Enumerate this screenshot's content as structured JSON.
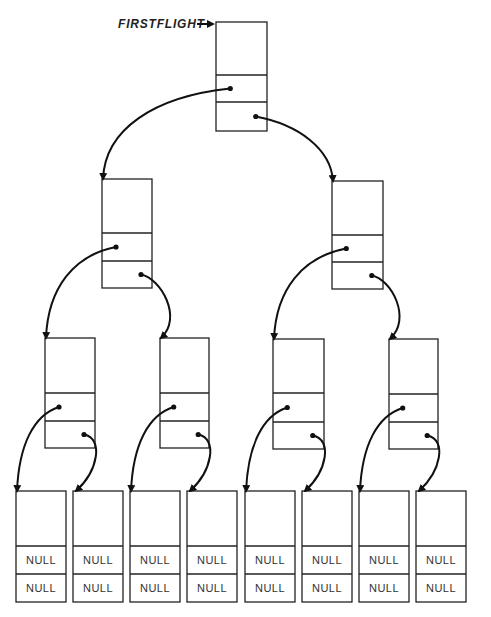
{
  "root_label": "FIRSTFLIGHT",
  "null_text": "NULL",
  "nodes": [
    {
      "id": "root",
      "x": 216,
      "y": 22,
      "w": 51,
      "h": 109,
      "d1": 75,
      "d2": 102
    },
    {
      "id": "l1-left",
      "x": 102,
      "y": 179,
      "w": 50,
      "h": 109,
      "d1": 233,
      "d2": 261
    },
    {
      "id": "l1-right",
      "x": 332,
      "y": 181,
      "w": 51,
      "h": 108,
      "d1": 235,
      "d2": 262
    },
    {
      "id": "l2-0",
      "x": 45,
      "y": 338,
      "w": 50,
      "h": 110,
      "d1": 393,
      "d2": 421
    },
    {
      "id": "l2-1",
      "x": 160,
      "y": 338,
      "w": 49,
      "h": 110,
      "d1": 393,
      "d2": 421
    },
    {
      "id": "l2-2",
      "x": 273,
      "y": 339,
      "w": 51,
      "h": 110,
      "d1": 393,
      "d2": 422
    },
    {
      "id": "l2-3",
      "x": 389,
      "y": 339,
      "w": 49,
      "h": 110,
      "d1": 394,
      "d2": 422
    }
  ],
  "leaves": [
    {
      "x": 16
    },
    {
      "x": 73
    },
    {
      "x": 130
    },
    {
      "x": 187
    },
    {
      "x": 245
    },
    {
      "x": 302
    },
    {
      "x": 359
    },
    {
      "x": 416
    }
  ],
  "leaf_geom": {
    "y": 491,
    "w": 50,
    "h": 111,
    "d1": 546,
    "d2": 574
  },
  "colors": {
    "line": "#222222",
    "background": "#ffffff"
  }
}
